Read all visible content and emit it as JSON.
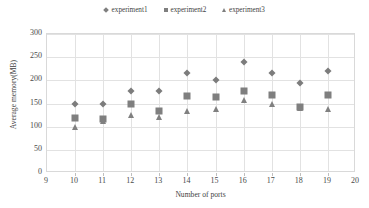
{
  "chart_data": {
    "type": "scatter",
    "title": "",
    "xlabel": "Number of ports",
    "ylabel": "Average memory(MB)",
    "xlim": [
      9,
      20
    ],
    "ylim": [
      0,
      300
    ],
    "xticks": [
      9,
      10,
      11,
      12,
      13,
      14,
      15,
      16,
      17,
      18,
      19,
      20
    ],
    "yticks": [
      0,
      50,
      100,
      150,
      200,
      250,
      300
    ],
    "grid": "horizontal-and-vertical",
    "legend_position": "top-center",
    "x": [
      10,
      11,
      12,
      13,
      14,
      15,
      16,
      17,
      18,
      19
    ],
    "series": [
      {
        "name": "experiment1",
        "marker": "diamond",
        "color": "#7c7c7c",
        "values": [
          150,
          149,
          177,
          176,
          215,
          201,
          240,
          215,
          195,
          221
        ]
      },
      {
        "name": "experiment2",
        "marker": "square",
        "color": "#7f7f7f",
        "values": [
          118,
          116,
          148,
          134,
          167,
          164,
          178,
          168,
          143,
          168
        ]
      },
      {
        "name": "experiment3",
        "marker": "triangle",
        "color": "#808080",
        "values": [
          99,
          113,
          125,
          121,
          134,
          139,
          157,
          150,
          140,
          138
        ]
      }
    ]
  },
  "legend": {
    "items": [
      {
        "label": "experiment1",
        "marker": "diamond-icon"
      },
      {
        "label": "experiment2",
        "marker": "square-icon"
      },
      {
        "label": "experiment3",
        "marker": "triangle-icon"
      }
    ]
  },
  "colors": {
    "marker_gray": "#7f7f7f",
    "grid": "#e2e2e2",
    "frame": "#d9d9d9",
    "text": "#3f3f3f",
    "background": "#ffffff"
  }
}
